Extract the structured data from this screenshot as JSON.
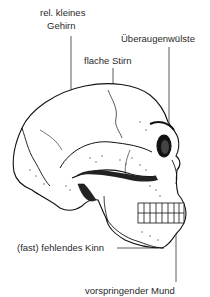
{
  "figure": {
    "labels": {
      "brain_line1": "rel. kleines",
      "brain_line2": "Gehirn",
      "forehead": "flache Stirn",
      "brow_ridges": "Überaugenwülste",
      "chin": "(fast) fehlendes Kinn",
      "mouth": "vorspringender Mund"
    }
  }
}
